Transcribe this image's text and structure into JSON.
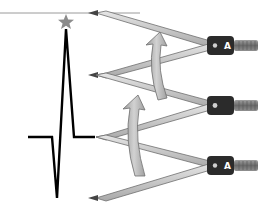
{
  "diagram": {
    "colors": {
      "waveform": "#000000",
      "reference_line": "#999999",
      "star": "#8c8c8c",
      "caliper_leg": "#c8c8c8",
      "caliper_leg_edge": "#6e6e6e",
      "caliper_head": "#2b2b2b",
      "caliper_knob": "#808080",
      "arrow_fill": "#bfbfbf",
      "arrow_edge": "#6e6e6e"
    },
    "calipers": [
      {
        "id": "top",
        "head_label": "A"
      },
      {
        "id": "middle",
        "head_label": ""
      },
      {
        "id": "bottom",
        "head_label": "A"
      }
    ],
    "arrows": [
      {
        "id": "upper-arrow",
        "direction": "up"
      },
      {
        "id": "lower-arrow",
        "direction": "up"
      }
    ]
  }
}
